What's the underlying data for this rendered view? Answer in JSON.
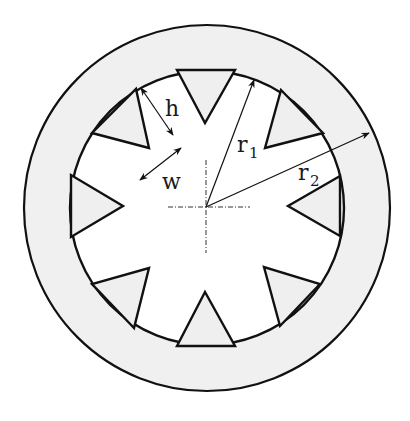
{
  "figure": {
    "colors": {
      "background": "#ffffff",
      "annulus_fill": "#f0f0f0",
      "tooth_fill": "#efefef",
      "bore_fill": "#ffffff",
      "stroke": "#111111"
    },
    "geometry": {
      "center": [
        207,
        208
      ],
      "outer_radius": 183,
      "inner_radius": 137,
      "tooth_count": 8
    },
    "teeth": [
      {
        "name": "top",
        "points": [
          [
            177,
            70
          ],
          [
            235,
            70
          ],
          [
            205,
            123
          ]
        ]
      },
      {
        "name": "upper-right",
        "points": [
          [
            281,
            90
          ],
          [
            323,
            133
          ],
          [
            265,
            148
          ]
        ]
      },
      {
        "name": "right",
        "points": [
          [
            340,
            176
          ],
          [
            340,
            236
          ],
          [
            288,
            206
          ]
        ]
      },
      {
        "name": "lower-right",
        "points": [
          [
            320,
            284
          ],
          [
            280,
            326
          ],
          [
            264,
            267
          ]
        ]
      },
      {
        "name": "bottom",
        "points": [
          [
            235,
            346
          ],
          [
            177,
            346
          ],
          [
            205,
            292
          ]
        ]
      },
      {
        "name": "lower-left",
        "points": [
          [
            134,
            328
          ],
          [
            92,
            284
          ],
          [
            149,
            268
          ]
        ]
      },
      {
        "name": "left",
        "points": [
          [
            71,
            237
          ],
          [
            71,
            175
          ],
          [
            123,
            206
          ]
        ]
      },
      {
        "name": "upper-left",
        "points": [
          [
            92,
            133
          ],
          [
            136,
            89
          ],
          [
            149,
            148
          ]
        ]
      }
    ],
    "centerlines": {
      "vertical": {
        "x": 206,
        "y1": 160,
        "y2": 253
      },
      "horizontal": {
        "y": 207,
        "x1": 168,
        "x2": 250
      }
    },
    "dimensions": {
      "r1": {
        "label": "r",
        "subscript": "1",
        "from": [
          206,
          207
        ],
        "to": [
          254,
          80
        ],
        "label_pos": [
          237,
          152
        ],
        "sub_pos": [
          249,
          158
        ]
      },
      "r2": {
        "label": "r",
        "subscript": "2",
        "from": [
          206,
          207
        ],
        "to": [
          369,
          133
        ],
        "label_pos": [
          298,
          180
        ],
        "sub_pos": [
          310,
          186
        ]
      },
      "h": {
        "label": "h",
        "from": [
          141,
          88
        ],
        "to": [
          173,
          135
        ],
        "label_pos": [
          165,
          116
        ]
      },
      "w": {
        "label": "w",
        "from": [
          140,
          180
        ],
        "to": [
          181,
          148
        ],
        "label_pos": [
          162,
          189
        ]
      }
    }
  }
}
